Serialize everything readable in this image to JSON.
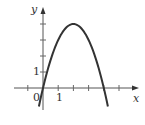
{
  "chart_data": {
    "type": "line",
    "title": "",
    "xlabel": "x",
    "ylabel": "y",
    "function": "y = 4x - x^2",
    "series": [
      {
        "name": "parabola",
        "x": [
          -0.27,
          0,
          0.5,
          1,
          1.5,
          2,
          2.5,
          3,
          3.5,
          4,
          4.27
        ],
        "values": [
          -1.15,
          0,
          1.75,
          3,
          3.75,
          4,
          3.75,
          3,
          1.75,
          0,
          -1.15
        ]
      }
    ],
    "xlim": [
      -1,
      6
    ],
    "ylim": [
      -1.2,
      5
    ],
    "x_ticks": [
      -1,
      1,
      2,
      3,
      4,
      5
    ],
    "y_ticks": [
      1,
      2,
      3,
      4
    ],
    "tick_labels": {
      "x": "1",
      "y": "1",
      "origin": "0"
    },
    "grid": false,
    "legend": null,
    "colors": {
      "curve": "#333333",
      "axes": "#555555"
    }
  }
}
